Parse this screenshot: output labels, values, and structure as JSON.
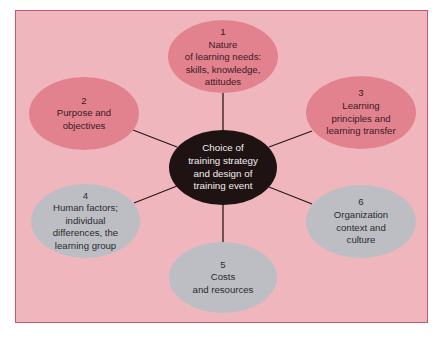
{
  "diagram": {
    "type": "hub-and-spoke",
    "colors": {
      "background": "#F0B6BE",
      "frame_border": "#C9576A",
      "pink_node": "#E3828F",
      "grey_node": "#BCBEC4",
      "center_node": "#1E1212",
      "connector": "#2a1a1c"
    },
    "center": {
      "lines": [
        "Choice of",
        "training strategy",
        "and design of",
        "training event"
      ]
    },
    "nodes": [
      {
        "number": "1",
        "lines": [
          "Nature",
          "of learning needs:",
          "skills, knowledge,",
          "attitudes"
        ],
        "color": "pink"
      },
      {
        "number": "2",
        "lines": [
          "Purpose and",
          "objectives"
        ],
        "color": "pink"
      },
      {
        "number": "3",
        "lines": [
          "Learning",
          "principles and",
          "learning transfer"
        ],
        "color": "pink"
      },
      {
        "number": "4",
        "lines": [
          "Human factors;",
          "individual",
          "differences, the",
          "learning group"
        ],
        "color": "grey"
      },
      {
        "number": "5",
        "lines": [
          "Costs",
          "and resources"
        ],
        "color": "grey"
      },
      {
        "number": "6",
        "lines": [
          "Organization",
          "context and",
          "culture"
        ],
        "color": "grey"
      }
    ]
  }
}
